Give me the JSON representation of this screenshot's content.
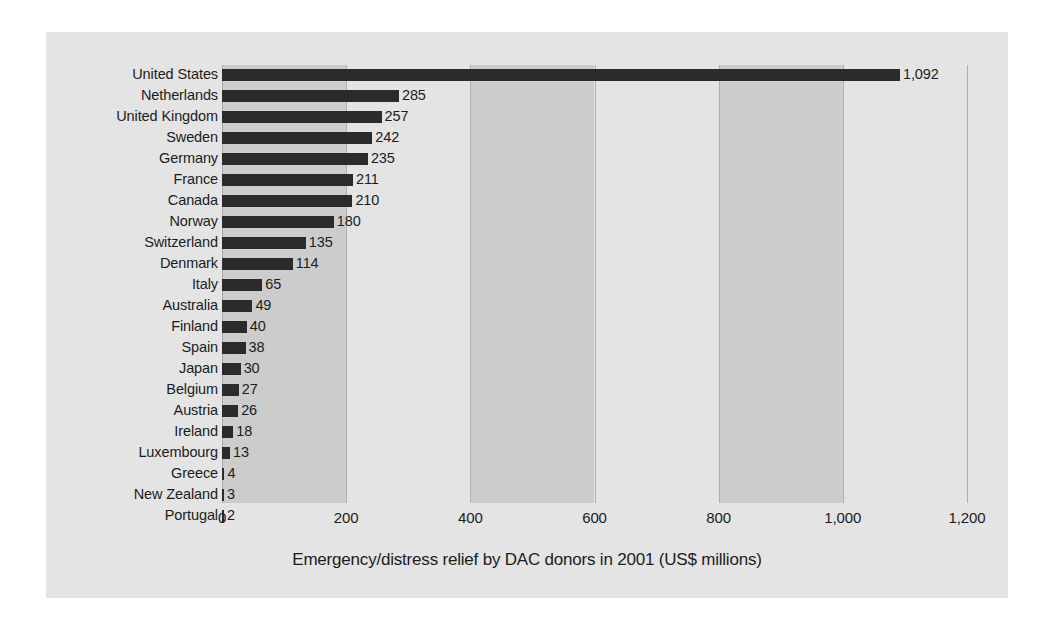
{
  "chart_data": {
    "type": "bar",
    "orientation": "horizontal",
    "title": "",
    "xlabel": "Emergency/distress relief by DAC donors in 2001 (US$ millions)",
    "ylabel": "",
    "xlim": [
      0,
      1200
    ],
    "xticks": [
      0,
      200,
      400,
      600,
      800,
      1000,
      1200
    ],
    "xtick_labels": [
      "0",
      "200",
      "400",
      "600",
      "800",
      "1,000",
      "1,200"
    ],
    "grid": true,
    "legend": "none",
    "bar_color": "#2b2b2b",
    "band_color": "#cccccc",
    "plot_background": "#e4e4e4",
    "categories": [
      "United States",
      "Netherlands",
      "United Kingdom",
      "Sweden",
      "Germany",
      "France",
      "Canada",
      "Norway",
      "Switzerland",
      "Denmark",
      "Italy",
      "Australia",
      "Finland",
      "Spain",
      "Japan",
      "Belgium",
      "Austria",
      "Ireland",
      "Luxembourg",
      "Greece",
      "New Zealand",
      "Portugal"
    ],
    "values": [
      1092,
      285,
      257,
      242,
      235,
      211,
      210,
      180,
      135,
      114,
      65,
      49,
      40,
      38,
      30,
      27,
      26,
      18,
      13,
      4,
      3,
      2
    ],
    "value_labels": [
      "1,092",
      "285",
      "257",
      "242",
      "235",
      "211",
      "210",
      "180",
      "135",
      "114",
      "65",
      "49",
      "40",
      "38",
      "30",
      "27",
      "26",
      "18",
      "13",
      "4",
      "3",
      "2"
    ],
    "shaded_bands": [
      [
        0,
        200
      ],
      [
        400,
        600
      ],
      [
        800,
        1000
      ]
    ]
  }
}
